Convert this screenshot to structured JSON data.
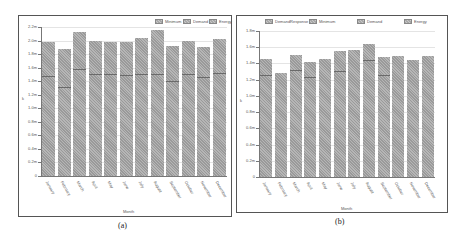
{
  "chart_data": [
    {
      "type": "bar",
      "panel": "(a)",
      "title": "",
      "xlabel": "Month",
      "ylabel": "k",
      "categories": [
        "January",
        "February",
        "March",
        "April",
        "May",
        "June",
        "July",
        "August",
        "September",
        "October",
        "November",
        "December"
      ],
      "series": [
        {
          "name": "Minimum",
          "values": [
            null,
            null,
            null,
            null,
            null,
            null,
            null,
            null,
            null,
            null,
            null,
            null
          ]
        },
        {
          "name": "Demand",
          "values": [
            1.48,
            1.32,
            1.58,
            1.5,
            1.5,
            1.49,
            1.5,
            1.5,
            1.4,
            1.51,
            1.46,
            1.52
          ]
        },
        {
          "name": "Energy",
          "values": [
            1.98,
            1.88,
            2.13,
            2.0,
            1.98,
            1.98,
            2.04,
            2.16,
            1.92,
            2.0,
            1.91,
            2.03
          ]
        }
      ],
      "unit": "m",
      "yticks": [
        "0",
        "0.2m",
        "0.4m",
        "0.6m",
        "0.8m",
        "1.0m",
        "1.2m",
        "1.4m",
        "1.6m",
        "1.8m",
        "2.0m",
        "2.2m"
      ],
      "ylim": [
        0,
        2.2
      ],
      "grid": true,
      "legend_position": "top-right"
    },
    {
      "type": "bar",
      "panel": "(b)",
      "title": "",
      "xlabel": "Month",
      "ylabel": "k",
      "categories": [
        "January",
        "February",
        "March",
        "April",
        "May",
        "June",
        "July",
        "August",
        "September",
        "October",
        "November",
        "December"
      ],
      "series": [
        {
          "name": "DemandResponse",
          "values": [
            null,
            null,
            null,
            null,
            null,
            null,
            null,
            null,
            null,
            null,
            null,
            null
          ]
        },
        {
          "name": "Minimum",
          "values": [
            null,
            null,
            null,
            null,
            null,
            null,
            null,
            null,
            null,
            null,
            null,
            null
          ]
        },
        {
          "name": "Demand",
          "values": [
            1.26,
            null,
            1.32,
            1.23,
            null,
            1.31,
            null,
            1.44,
            1.26,
            null,
            null,
            null
          ]
        },
        {
          "name": "Energy",
          "values": [
            1.45,
            1.28,
            1.5,
            1.42,
            1.46,
            1.55,
            1.57,
            1.64,
            1.48,
            1.49,
            1.44,
            1.49
          ]
        }
      ],
      "unit": "m",
      "yticks": [
        "0",
        "0.2m",
        "0.4m",
        "0.6m",
        "0.8m",
        "1.0m",
        "1.2m",
        "1.4m",
        "1.6m",
        "1.8m"
      ],
      "ylim": [
        0,
        1.8
      ],
      "grid": true,
      "legend_position": "top"
    }
  ],
  "panels": {
    "a": {
      "caption": "(a)",
      "legend": [
        "Minimum",
        "Demand",
        "Energy"
      ],
      "xlabel": "Month",
      "ylabel": "k"
    },
    "b": {
      "caption": "(b)",
      "legend": [
        "DemandResponse",
        "Minimum",
        "Demand",
        "Energy"
      ],
      "xlabel": "Month",
      "ylabel": "k"
    }
  },
  "colors": {
    "bar_dark": "#9a9a9a",
    "bar_light": "#b6b6b6",
    "grid": "#e4e4e4",
    "axis": "#777777",
    "frame": "#555555"
  }
}
